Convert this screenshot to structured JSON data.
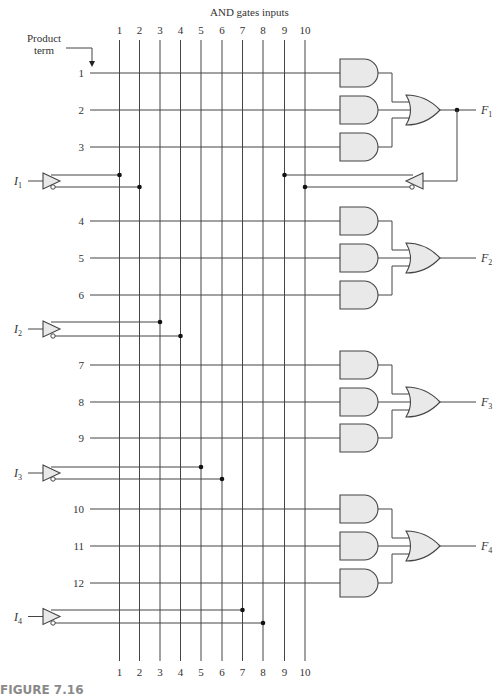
{
  "title": "AND gates inputs",
  "product_term_label": [
    "Product",
    "term"
  ],
  "caption": "FIGURE 7.16",
  "columns": {
    "labels": [
      "1",
      "2",
      "3",
      "4",
      "5",
      "6",
      "7",
      "8",
      "9",
      "10"
    ],
    "x": [
      119.5,
      139.5,
      160,
      180.5,
      201,
      222,
      242.5,
      263,
      284.5,
      305
    ],
    "top_y": 40,
    "bottom_y": 661
  },
  "product_terms": [
    {
      "label": "1",
      "y": 73
    },
    {
      "label": "2",
      "y": 110
    },
    {
      "label": "3",
      "y": 147
    },
    {
      "label": "4",
      "y": 221
    },
    {
      "label": "5",
      "y": 258
    },
    {
      "label": "6",
      "y": 295
    },
    {
      "label": "7",
      "y": 365
    },
    {
      "label": "8",
      "y": 402
    },
    {
      "label": "9",
      "y": 438
    },
    {
      "label": "10",
      "y": 509
    },
    {
      "label": "11",
      "y": 546
    },
    {
      "label": "12",
      "y": 583
    }
  ],
  "inputs": [
    {
      "name": "I",
      "sub": "1",
      "y_true": 175,
      "y_comp": 187,
      "col_true": 0,
      "col_comp": 1
    },
    {
      "name": "I",
      "sub": "2",
      "y_true": 322,
      "y_comp": 336,
      "col_true": 2,
      "col_comp": 3
    },
    {
      "name": "I",
      "sub": "3",
      "y_true": 467,
      "y_comp": 479,
      "col_true": 4,
      "col_comp": 5
    },
    {
      "name": "I",
      "sub": "4",
      "y_true": 610,
      "y_comp": 623,
      "col_true": 6,
      "col_comp": 7
    }
  ],
  "outputs": [
    {
      "name": "F",
      "sub": "1",
      "terms": [
        0,
        1,
        2
      ]
    },
    {
      "name": "F",
      "sub": "2",
      "terms": [
        3,
        4,
        5
      ]
    },
    {
      "name": "F",
      "sub": "3",
      "terms": [
        6,
        7,
        8
      ]
    },
    {
      "name": "F",
      "sub": "4",
      "terms": [
        9,
        10,
        11
      ]
    }
  ],
  "feedback": {
    "from_output": 0,
    "y_true": 175,
    "y_comp": 187,
    "col_true": 8,
    "col_comp": 9,
    "junction_x": 457
  },
  "colors": {
    "wire": "#444444",
    "gate_fill": "#e9e9e9",
    "caption": "#8a8a8a"
  }
}
